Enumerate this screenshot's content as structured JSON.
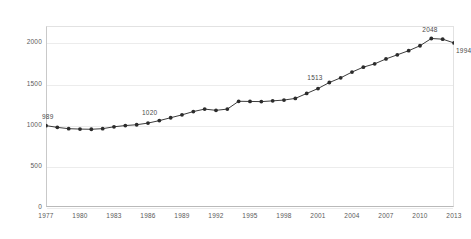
{
  "chart_data": {
    "type": "line",
    "title": "",
    "subtitle": "",
    "xlabel": "",
    "ylabel": "",
    "xlim": [
      1977,
      2013
    ],
    "ylim": [
      0,
      2200
    ],
    "yticks": [
      0,
      500,
      1000,
      1500,
      2000
    ],
    "ytick_labels": [
      "0",
      "500",
      "1000",
      "1500",
      "2000"
    ],
    "xticks": [
      1977,
      1980,
      1983,
      1986,
      1989,
      1992,
      1995,
      1998,
      2001,
      2004,
      2007,
      2010,
      2013
    ],
    "xtick_labels": [
      "1977",
      "1980",
      "1983",
      "1986",
      "1989",
      "1992",
      "1995",
      "1998",
      "2001",
      "2004",
      "2007",
      "2010",
      "2013"
    ],
    "grid": true,
    "legend": null,
    "marker": "circle",
    "line_color": "#3b3b3b",
    "marker_color": "#2b2b2b",
    "grid_color": "#ececec",
    "x": [
      1977,
      1978,
      1979,
      1980,
      1981,
      1982,
      1983,
      1984,
      1985,
      1986,
      1987,
      1988,
      1989,
      1990,
      1991,
      1992,
      1993,
      1994,
      1995,
      1996,
      1997,
      1998,
      1999,
      2000,
      2001,
      2002,
      2003,
      2004,
      2005,
      2006,
      2007,
      2008,
      2009,
      2010,
      2011,
      2012,
      2013
    ],
    "values": [
      989,
      968,
      952,
      947,
      945,
      952,
      975,
      990,
      1000,
      1020,
      1050,
      1085,
      1120,
      1160,
      1190,
      1175,
      1190,
      1285,
      1283,
      1281,
      1290,
      1300,
      1320,
      1380,
      1440,
      1513,
      1570,
      1640,
      1700,
      1740,
      1800,
      1850,
      1900,
      1960,
      2048,
      2040,
      1994
    ],
    "point_labels": [
      {
        "x": 1977,
        "value": 989,
        "text": "989"
      },
      {
        "x": 1986,
        "value": 1020,
        "text": "1020"
      },
      {
        "x": 2002,
        "value": 1513,
        "text": "1513"
      },
      {
        "x": 2011,
        "value": 2048,
        "text": "2048"
      },
      {
        "x": 2013,
        "value": 1994,
        "text": "1994"
      }
    ],
    "annotations": []
  }
}
